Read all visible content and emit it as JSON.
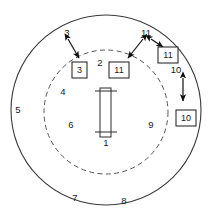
{
  "figure": {
    "kind": "patent-drawing",
    "background_color": "#ffffff",
    "line_color": "#3a3a3a",
    "callout_border_color": "#1a1a1a",
    "text_color": "#1a1a1a",
    "outer_circle": {
      "cx": 106,
      "cy": 110,
      "r": 95,
      "style": "solid"
    },
    "inner_circle": {
      "cx": 106,
      "cy": 112,
      "r": 62,
      "style": "dashed"
    },
    "center_part": {
      "label": "1",
      "rect": {
        "x": 100,
        "y": 88,
        "w": 11,
        "h": 49
      },
      "crossbars": [
        {
          "x1": 95,
          "y1": 91,
          "x2": 117,
          "y2": 91
        },
        {
          "x1": 95,
          "y1": 132,
          "x2": 117,
          "y2": 132
        }
      ]
    },
    "plain_labels": [
      {
        "id": "label-1",
        "text": "1",
        "x": 106,
        "y": 143
      },
      {
        "id": "label-2",
        "text": "2",
        "x": 100,
        "y": 63
      },
      {
        "id": "label-3",
        "text": "3",
        "x": 67,
        "y": 33
      },
      {
        "id": "label-4",
        "text": "4",
        "x": 63,
        "y": 92
      },
      {
        "id": "label-5",
        "text": "5",
        "x": 18,
        "y": 110
      },
      {
        "id": "label-6",
        "text": "6",
        "x": 71,
        "y": 125
      },
      {
        "id": "label-7",
        "text": "7",
        "x": 75,
        "y": 198
      },
      {
        "id": "label-8",
        "text": "8",
        "x": 124,
        "y": 201
      },
      {
        "id": "label-9",
        "text": "9",
        "x": 151,
        "y": 125
      },
      {
        "id": "label-10",
        "text": "10",
        "x": 176,
        "y": 70
      },
      {
        "id": "label-11",
        "text": "11",
        "x": 146,
        "y": 33
      }
    ],
    "boxed_labels": [
      {
        "id": "boxed-3",
        "text": "3",
        "x": 72,
        "y": 62,
        "w": 15,
        "h": 16
      },
      {
        "id": "boxed-11",
        "text": "11",
        "x": 109,
        "y": 62,
        "w": 20,
        "h": 16
      },
      {
        "id": "boxed-11-outer",
        "text": "11",
        "x": 158,
        "y": 47,
        "w": 20,
        "h": 16
      },
      {
        "id": "boxed-10",
        "text": "10",
        "x": 176,
        "y": 110,
        "w": 20,
        "h": 16
      }
    ],
    "leaders": [
      {
        "id": "leader-3",
        "from": [
          68,
          39
        ],
        "to": [
          79,
          58
        ],
        "heads": "both"
      },
      {
        "id": "leader-11-inner",
        "from": [
          143,
          39
        ],
        "to": [
          128,
          58
        ],
        "heads": "both"
      },
      {
        "id": "leader-11-outer",
        "from": [
          151,
          39
        ],
        "to": [
          163,
          47
        ],
        "heads": "both"
      },
      {
        "id": "leader-10",
        "from": [
          183,
          78
        ],
        "to": [
          183,
          101
        ],
        "heads": "both"
      }
    ]
  }
}
